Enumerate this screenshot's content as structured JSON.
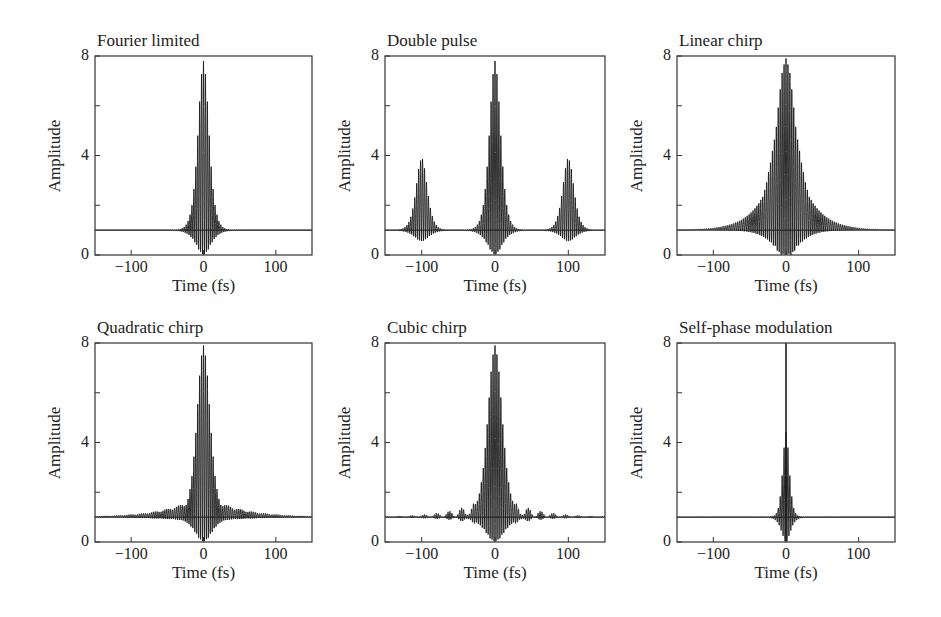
{
  "figure": {
    "panel_boxes": [
      {
        "left": 95,
        "top": 56,
        "right": 312,
        "bottom": 255
      },
      {
        "left": 385,
        "top": 56,
        "right": 605,
        "bottom": 255
      },
      {
        "left": 677,
        "top": 56,
        "right": 895,
        "bottom": 255
      },
      {
        "left": 95,
        "top": 343,
        "right": 312,
        "bottom": 542
      },
      {
        "left": 385,
        "top": 343,
        "right": 605,
        "bottom": 542
      },
      {
        "left": 677,
        "top": 343,
        "right": 895,
        "bottom": 542
      }
    ],
    "line_color": "#1a1a1a",
    "axis_color": "#333333"
  },
  "chart_data": [
    {
      "type": "line",
      "title": "Fourier limited",
      "xlabel": "Time (fs)",
      "ylabel": "Amplitude",
      "xlim": [
        -150,
        150
      ],
      "ylim": [
        0,
        8
      ],
      "xticks": [
        -100,
        0,
        100
      ],
      "xtick_labels": [
        "−100",
        "0",
        "100"
      ],
      "yticks": [
        0,
        2,
        4,
        6,
        8
      ],
      "ytick_labels": [
        "0",
        "",
        "4",
        "",
        "8"
      ],
      "grid": false,
      "baseline": 1,
      "model": "pulse",
      "pulses": [
        {
          "center": 0,
          "width": 10,
          "peak": 7.8
        }
      ],
      "description": "Single short pulse centered at 0 fs; interferometric trace with peak ~7.8, baseline 1, oscillation filling down to 0."
    },
    {
      "type": "line",
      "title": "Double pulse",
      "xlabel": "Time (fs)",
      "ylabel": "Amplitude",
      "xlim": [
        -150,
        150
      ],
      "ylim": [
        0,
        8
      ],
      "xticks": [
        -100,
        0,
        100
      ],
      "xtick_labels": [
        "−100",
        "0",
        "100"
      ],
      "yticks": [
        0,
        2,
        4,
        6,
        8
      ],
      "ytick_labels": [
        "0",
        "",
        "4",
        "",
        "8"
      ],
      "grid": false,
      "baseline": 1,
      "model": "pulse",
      "pulses": [
        {
          "center": -100,
          "width": 10,
          "peak": 3.9,
          "floor": 0.55
        },
        {
          "center": 0,
          "width": 10,
          "peak": 7.8
        },
        {
          "center": 100,
          "width": 10,
          "peak": 3.9,
          "floor": 0.55
        }
      ],
      "description": "Central peak ~7.8 at 0 fs with two satellite peaks ~3.9 at ±100 fs."
    },
    {
      "type": "line",
      "title": "Linear chirp",
      "xlabel": "Time (fs)",
      "ylabel": "Amplitude",
      "xlim": [
        -150,
        150
      ],
      "ylim": [
        0,
        8
      ],
      "xticks": [
        -100,
        0,
        100
      ],
      "xtick_labels": [
        "−100",
        "0",
        "100"
      ],
      "yticks": [
        0,
        2,
        4,
        6,
        8
      ],
      "ytick_labels": [
        "0",
        "",
        "4",
        "",
        "8"
      ],
      "grid": false,
      "baseline": 1,
      "model": "linear_chirp",
      "pulses": [
        {
          "center": 0,
          "width": 18,
          "peak": 7.9
        }
      ],
      "wing": {
        "halfwidth": 33,
        "height_at_edge": 2.3,
        "decay": 35
      },
      "description": "Peak ~7.9 with oscillations confined to ±33 fs; smooth wings of ~2.3 decaying to 1 at the edges."
    },
    {
      "type": "line",
      "title": "Quadratic chirp",
      "xlabel": "Time (fs)",
      "ylabel": "Amplitude",
      "xlim": [
        -150,
        150
      ],
      "ylim": [
        0,
        8
      ],
      "xticks": [
        -100,
        0,
        100
      ],
      "xtick_labels": [
        "−100",
        "0",
        "100"
      ],
      "yticks": [
        0,
        2,
        4,
        6,
        8
      ],
      "ytick_labels": [
        "0",
        "",
        "4",
        "",
        "8"
      ],
      "grid": false,
      "baseline": 1,
      "model": "quadratic_chirp",
      "pulses": [
        {
          "center": 0,
          "width": 12,
          "peak": 7.9
        }
      ],
      "tail": {
        "height": 1.0,
        "decay": 45,
        "ripple_period": 17
      },
      "description": "Peak ~7.9; broad rippled pedestal up to ~2 near ±30 fs decaying to 1 at the edges."
    },
    {
      "type": "line",
      "title": "Cubic chirp",
      "xlabel": "Time (fs)",
      "ylabel": "Amplitude",
      "xlim": [
        -150,
        150
      ],
      "ylim": [
        0,
        8
      ],
      "xticks": [
        -100,
        0,
        100
      ],
      "xtick_labels": [
        "−100",
        "0",
        "100"
      ],
      "yticks": [
        0,
        2,
        4,
        6,
        8
      ],
      "ytick_labels": [
        "0",
        "",
        "4",
        "",
        "8"
      ],
      "grid": false,
      "baseline": 1,
      "model": "cubic_chirp",
      "pulses": [
        {
          "center": 0,
          "width": 13,
          "peak": 7.9
        }
      ],
      "lobes": {
        "spacing": 17,
        "first_height": 0.7,
        "decay": 40
      },
      "description": "Peak ~7.9; discrete beaded side lobes spaced ~17 fs apart, decaying symmetrically."
    },
    {
      "type": "line",
      "title": "Self-phase modulation",
      "xlabel": "Time (fs)",
      "ylabel": "Amplitude",
      "xlim": [
        -150,
        150
      ],
      "ylim": [
        0,
        8
      ],
      "xticks": [
        -100,
        0,
        100
      ],
      "xtick_labels": [
        "−100",
        "0",
        "100"
      ],
      "yticks": [
        0,
        2,
        4,
        6,
        8
      ],
      "ytick_labels": [
        "0",
        "",
        "4",
        "",
        "8"
      ],
      "grid": false,
      "baseline": 1,
      "model": "spm",
      "pulses": [
        {
          "center": 0,
          "width": 6,
          "peak": 4.4
        }
      ],
      "spike": {
        "center": 0,
        "peak": 8.0
      },
      "description": "Narrow coherent spike reaching the top of the axis (≥8) at 0 fs, on a narrow envelope ~4.4 with shoulders ~3.4; baseline 1."
    }
  ]
}
